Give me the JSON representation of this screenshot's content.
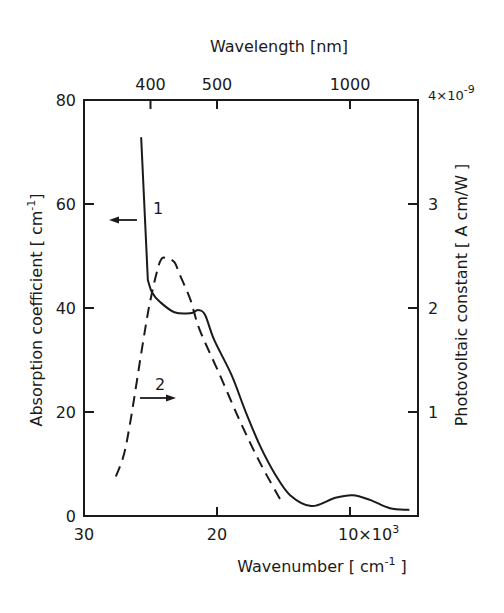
{
  "chart_data": {
    "type": "line",
    "title": "",
    "xlabel": "Wavenumber [ cm^-1 ]",
    "xlabel_parts": {
      "main": "Wavenumber [ cm",
      "sup": "-1",
      "end": " ]"
    },
    "x_top_label": "Wavelength [nm]",
    "ylabel_left": "Absorption coefficient [cm^-1]",
    "ylabel_left_parts": {
      "main": "Absorption  coefficient  [ cm",
      "sup": "-1",
      "end": "]"
    },
    "ylabel_right": "Photovoltaic constant [ A cm/W ]",
    "xlim": [
      30,
      4.8
    ],
    "ylim_left": [
      0,
      80
    ],
    "ylim_right": [
      0,
      4e-09
    ],
    "x_ticks": [
      {
        "value": 30,
        "label": "30"
      },
      {
        "value": 20,
        "label": "20"
      },
      {
        "value": 10,
        "label": "10×10",
        "sup": "3"
      }
    ],
    "x_top_ticks": [
      {
        "wavelength_nm": 400,
        "label": "400",
        "wavenumber": 25
      },
      {
        "wavelength_nm": 500,
        "label": "500",
        "wavenumber": 20
      },
      {
        "wavelength_nm": 1000,
        "label": "1000",
        "wavenumber": 10
      }
    ],
    "y_left_ticks": [
      {
        "value": 0,
        "label": "0"
      },
      {
        "value": 20,
        "label": "20"
      },
      {
        "value": 40,
        "label": "40"
      },
      {
        "value": 60,
        "label": "60"
      },
      {
        "value": 80,
        "label": "80"
      }
    ],
    "y_right_ticks": [
      {
        "value": 1,
        "label": "1"
      },
      {
        "value": 2,
        "label": "2"
      },
      {
        "value": 3,
        "label": "3"
      },
      {
        "value": 4,
        "label": "4×10",
        "sup": "-9"
      }
    ],
    "grid": false,
    "legend": "none (curves labeled inline with numbers and arrows pointing to axes)",
    "series": [
      {
        "name": "1",
        "description": "Absorption coefficient (left axis)",
        "style": "solid",
        "axis": "left",
        "arrow": "left",
        "x": [
          25.7,
          25.2,
          24.9,
          24.3,
          23.2,
          22.0,
          21.4,
          20.9,
          20.2,
          18.9,
          17.9,
          16.8,
          15.6,
          14.5,
          12.9,
          11.1,
          9.8,
          8.5,
          7.0,
          5.6
        ],
        "values": [
          72.7,
          45.4,
          43.1,
          41.2,
          39.2,
          39.0,
          39.6,
          38.7,
          33.8,
          27.1,
          20.4,
          13.7,
          7.9,
          4.0,
          1.9,
          3.5,
          4.0,
          3.1,
          1.5,
          1.2
        ]
      },
      {
        "name": "2",
        "description": "Photovoltaic constant (right axis, ×10^-9 A cm/W)",
        "style": "dashed",
        "axis": "right",
        "arrow": "right",
        "x": [
          27.6,
          27.0,
          26.5,
          25.6,
          25.0,
          24.3,
          23.8,
          23.2,
          22.8,
          22.0,
          21.3,
          19.8,
          18.3,
          16.8,
          15.2
        ],
        "values": [
          0.38,
          0.59,
          0.92,
          1.64,
          2.08,
          2.44,
          2.48,
          2.44,
          2.32,
          2.08,
          1.79,
          1.36,
          0.92,
          0.52,
          0.15
        ]
      }
    ],
    "annotations": [
      {
        "text": "1",
        "target": "solid curve",
        "arrow_direction": "left"
      },
      {
        "text": "2",
        "target": "dashed curve",
        "arrow_direction": "right"
      }
    ]
  }
}
